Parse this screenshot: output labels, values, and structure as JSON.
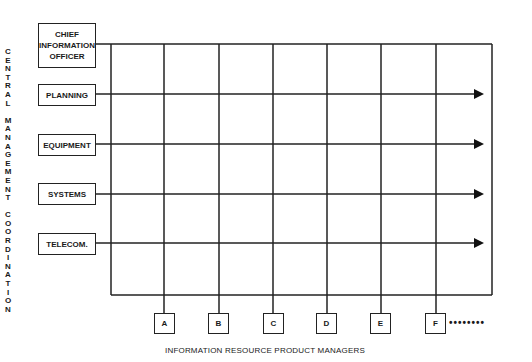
{
  "vertical_label": "CENTRAL MANAGEMENT COORDINATION",
  "vertical_letters": [
    "C",
    "E",
    "N",
    "T",
    "R",
    "A",
    "L",
    " ",
    "M",
    "A",
    "N",
    "A",
    "G",
    "E",
    "M",
    "E",
    "N",
    "T",
    " ",
    "C",
    "O",
    "O",
    "R",
    "D",
    "I",
    "N",
    "A",
    "T",
    "I",
    "O",
    "N"
  ],
  "row_boxes": [
    {
      "label": "CHIEF INFORMATION OFFICER",
      "lines": [
        "CHIEF",
        "INFORMATION",
        "OFFICER"
      ]
    },
    {
      "label": "PLANNING"
    },
    {
      "label": "EQUIPMENT"
    },
    {
      "label": "SYSTEMS"
    },
    {
      "label": "TELECOM."
    }
  ],
  "product_managers": [
    "A",
    "B",
    "C",
    "D",
    "E",
    "F"
  ],
  "continuation": "••••••••",
  "caption": "INFORMATION RESOURCE PRODUCT MANAGERS",
  "colors": {
    "line": "#222222",
    "background": "#ffffff"
  }
}
